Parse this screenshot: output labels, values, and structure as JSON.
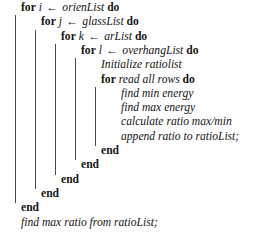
{
  "algorithm": {
    "arrow_glyph": "←",
    "keywords": {
      "for": "for",
      "do": "do",
      "end": "end"
    },
    "lines": [
      {
        "id": "for-orien",
        "type": "for",
        "indent": 0,
        "var": "i",
        "collection": "orienList"
      },
      {
        "id": "for-glass",
        "type": "for",
        "indent": 1,
        "var": "j",
        "collection": "glassList"
      },
      {
        "id": "for-ar",
        "type": "for",
        "indent": 2,
        "var": "k",
        "collection": "arList"
      },
      {
        "id": "for-overhang",
        "type": "for",
        "indent": 3,
        "var": "l",
        "collection": "overhangList"
      },
      {
        "id": "init-ratiolist",
        "type": "statement",
        "indent": 4,
        "text": "Initialize ratiolist"
      },
      {
        "id": "for-rows",
        "type": "for-plain",
        "indent": 4,
        "text": "read all rows"
      },
      {
        "id": "find-min",
        "type": "statement",
        "indent": 5,
        "text": "find min energy"
      },
      {
        "id": "find-max",
        "type": "statement",
        "indent": 5,
        "text": "find max energy"
      },
      {
        "id": "calc-ratio",
        "type": "statement",
        "indent": 5,
        "text": "calculate ratio max/min"
      },
      {
        "id": "append-ratio",
        "type": "statement",
        "indent": 5,
        "text": "append ratio to ratioList;"
      },
      {
        "id": "end-rows",
        "type": "end",
        "indent": 4,
        "text": "end"
      },
      {
        "id": "end-overhang",
        "type": "end",
        "indent": 3,
        "text": "end"
      },
      {
        "id": "end-ar",
        "type": "end",
        "indent": 2,
        "text": "end"
      },
      {
        "id": "end-glass",
        "type": "end",
        "indent": 1,
        "text": "end"
      },
      {
        "id": "end-orien",
        "type": "end",
        "indent": 0,
        "text": "end"
      },
      {
        "id": "final-find-max",
        "type": "statement",
        "indent": 0,
        "text": "find max ratio from ratioList;"
      }
    ],
    "indent_rules": [
      {
        "id": "rule-orien",
        "x": 15,
        "top": 16,
        "bottom": 199
      },
      {
        "id": "rule-glass",
        "x": 35,
        "top": 32,
        "bottom": 183
      },
      {
        "id": "rule-ar",
        "x": 55,
        "top": 48,
        "bottom": 167
      },
      {
        "id": "rule-overhang",
        "x": 75,
        "top": 64,
        "bottom": 151
      },
      {
        "id": "rule-rows",
        "x": 95,
        "top": 96,
        "bottom": 135
      }
    ]
  }
}
